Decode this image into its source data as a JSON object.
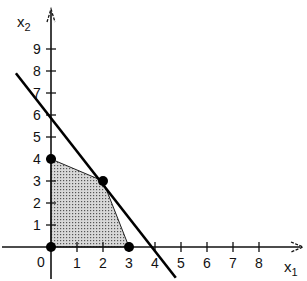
{
  "chart_data": {
    "type": "line",
    "title": "",
    "xlabel": "x1",
    "ylabel": "x2",
    "xlim": [
      0,
      9.5
    ],
    "ylim": [
      0,
      10
    ],
    "x_ticks": [
      0,
      1,
      2,
      3,
      4,
      5,
      6,
      7,
      8
    ],
    "y_ticks": [
      1,
      2,
      3,
      4,
      5,
      6,
      7,
      8,
      9
    ],
    "grid": false,
    "legend": null,
    "series": [
      {
        "name": "constraint-line",
        "kind": "line",
        "points": [
          [
            -1.35,
            7.9
          ],
          [
            4.8,
            -1.4
          ]
        ]
      },
      {
        "name": "feasible-region",
        "kind": "polygon",
        "fill": "dotted-gray",
        "points": [
          [
            0,
            0
          ],
          [
            0,
            4
          ],
          [
            2,
            3
          ],
          [
            3,
            0
          ]
        ]
      },
      {
        "name": "vertices",
        "kind": "scatter",
        "points": [
          [
            0,
            0
          ],
          [
            0,
            4
          ],
          [
            2,
            3
          ],
          [
            3,
            0
          ]
        ]
      }
    ]
  },
  "labels": {
    "x_axis": "x",
    "x_axis_sub": "1",
    "y_axis": "x",
    "y_axis_sub": "2",
    "origin": "0",
    "x_tick_labels": [
      "1",
      "2",
      "3",
      "4",
      "5",
      "6",
      "7",
      "8"
    ],
    "y_tick_labels": [
      "1",
      "2",
      "3",
      "4",
      "5",
      "6",
      "7",
      "8",
      "9"
    ]
  }
}
